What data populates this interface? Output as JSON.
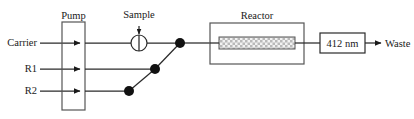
{
  "diagram": {
    "type": "flow-injection-analysis-manifold",
    "background_color": "#ffffff",
    "line_color": "#2a2a2a",
    "box_stroke_color": "#555555",
    "dot_color": "#111111",
    "inlets": [
      {
        "id": "carrier",
        "label": "Carrier",
        "y": 43
      },
      {
        "id": "reagent1",
        "label": "R1",
        "y": 69
      },
      {
        "id": "reagent2",
        "label": "R2",
        "y": 91
      }
    ],
    "pump": {
      "label": "Pump",
      "x": 62,
      "y": 22,
      "width": 23,
      "height": 88
    },
    "sample": {
      "label": "Sample",
      "center_x": 139,
      "center_y": 43,
      "radius": 8
    },
    "merge_points": [
      {
        "id": "merge-carrier",
        "x": 180,
        "y": 43
      },
      {
        "id": "merge-r1",
        "x": 155,
        "y": 69
      },
      {
        "id": "merge-r2",
        "x": 129,
        "y": 91
      }
    ],
    "reactor": {
      "label": "Reactor",
      "x": 210,
      "y": 23,
      "width": 94,
      "height": 41,
      "coil": {
        "x": 219,
        "y": 37,
        "width": 76,
        "height": 12,
        "pattern": "cross-hatch"
      }
    },
    "detector": {
      "label": "412 nm",
      "x": 320,
      "y": 33,
      "width": 45,
      "height": 20
    },
    "outlet": {
      "label": "Waste",
      "arrow_y": 43
    }
  }
}
